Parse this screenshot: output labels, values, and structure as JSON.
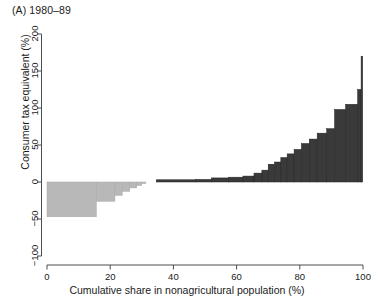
{
  "figure": {
    "panel_title": "(A) 1980–89",
    "bg_color": "#ffffff",
    "neg_color": "#b8b8b8",
    "pos_color": "#3a3a3a",
    "axis_color": "#4d4d4d"
  },
  "axes": {
    "xlabel": "Cumulative share in nonagricultural population (%)",
    "ylabel": "Consumer tax equivalent (%)",
    "xticks": [
      "0",
      "20",
      "40",
      "60",
      "80",
      "100"
    ],
    "yticks": [
      "200",
      "150",
      "100",
      "50",
      "0",
      "-50",
      "-100"
    ]
  },
  "chart_data": {
    "type": "bar",
    "title": "(A) 1980–89",
    "xlabel": "Cumulative share in nonagricultural population (%)",
    "ylabel": "Consumer tax equivalent (%)",
    "xlim": [
      0,
      100
    ],
    "ylim": [
      -100,
      200
    ],
    "xticks": [
      0,
      20,
      40,
      60,
      80,
      100
    ],
    "yticks": [
      -100,
      -50,
      0,
      50,
      100,
      150,
      200
    ],
    "grid": false,
    "legend": null,
    "orientation": "vertical",
    "note": "Width-weighted bars: each bar spans a cumulative population share interval; height is the consumer tax equivalent.",
    "bars": [
      {
        "x_start": 0.0,
        "x_end": 15.6,
        "value": -47.0,
        "group": "negative"
      },
      {
        "x_start": 15.6,
        "x_end": 21.5,
        "value": -26.0,
        "group": "negative"
      },
      {
        "x_start": 21.5,
        "x_end": 23.8,
        "value": -18.0,
        "group": "negative"
      },
      {
        "x_start": 23.8,
        "x_end": 26.2,
        "value": -12.5,
        "group": "negative"
      },
      {
        "x_start": 26.2,
        "x_end": 28.4,
        "value": -8.0,
        "group": "negative"
      },
      {
        "x_start": 28.4,
        "x_end": 30.0,
        "value": -4.5,
        "group": "negative"
      },
      {
        "x_start": 30.0,
        "x_end": 31.3,
        "value": -2.0,
        "group": "negative"
      },
      {
        "x_start": 34.6,
        "x_end": 47.0,
        "value": 3.0,
        "group": "positive"
      },
      {
        "x_start": 47.0,
        "x_end": 52.0,
        "value": 3.5,
        "group": "positive"
      },
      {
        "x_start": 52.0,
        "x_end": 57.5,
        "value": 5.5,
        "group": "positive"
      },
      {
        "x_start": 57.5,
        "x_end": 62.0,
        "value": 6.5,
        "group": "positive"
      },
      {
        "x_start": 62.0,
        "x_end": 65.5,
        "value": 8.0,
        "group": "positive"
      },
      {
        "x_start": 65.5,
        "x_end": 68.0,
        "value": 12.0,
        "group": "positive"
      },
      {
        "x_start": 68.0,
        "x_end": 70.0,
        "value": 16.0,
        "group": "positive"
      },
      {
        "x_start": 70.0,
        "x_end": 72.0,
        "value": 24.0,
        "group": "positive"
      },
      {
        "x_start": 72.0,
        "x_end": 74.0,
        "value": 27.0,
        "group": "positive"
      },
      {
        "x_start": 74.0,
        "x_end": 76.0,
        "value": 33.0,
        "group": "positive"
      },
      {
        "x_start": 76.0,
        "x_end": 78.2,
        "value": 38.0,
        "group": "positive"
      },
      {
        "x_start": 78.2,
        "x_end": 80.5,
        "value": 44.0,
        "group": "positive"
      },
      {
        "x_start": 80.5,
        "x_end": 83.0,
        "value": 52.0,
        "group": "positive"
      },
      {
        "x_start": 83.0,
        "x_end": 85.5,
        "value": 58.0,
        "group": "positive"
      },
      {
        "x_start": 85.5,
        "x_end": 88.5,
        "value": 66.0,
        "group": "positive"
      },
      {
        "x_start": 88.5,
        "x_end": 91.0,
        "value": 72.0,
        "group": "positive"
      },
      {
        "x_start": 91.0,
        "x_end": 94.5,
        "value": 98.0,
        "group": "positive"
      },
      {
        "x_start": 94.5,
        "x_end": 98.3,
        "value": 105.0,
        "group": "positive"
      },
      {
        "x_start": 98.3,
        "x_end": 99.4,
        "value": 125.0,
        "group": "positive"
      },
      {
        "x_start": 99.4,
        "x_end": 99.9,
        "value": 170.0,
        "group": "positive"
      }
    ]
  }
}
